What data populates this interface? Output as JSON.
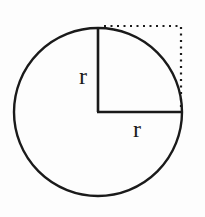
{
  "diagram": {
    "type": "circle-quadrant-radius",
    "labels": {
      "vertical_radius": "r",
      "horizontal_radius": "r"
    },
    "colors": {
      "stroke": "#1a1a1a",
      "background": "#fdfdfd"
    }
  }
}
